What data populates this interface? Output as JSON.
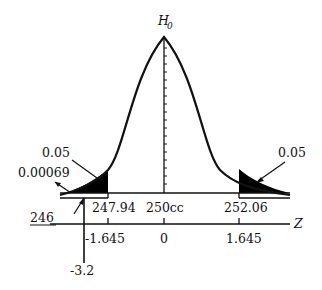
{
  "diagram": {
    "type": "normal-distribution-two-tailed-test",
    "null_hypothesis_label": "H",
    "null_hypothesis_subscript": "0",
    "colors": {
      "ink": "#111111",
      "shade": "#000000",
      "background": "#ffffff"
    },
    "tail_areas": {
      "left": "0.05",
      "right": "0.05",
      "p_value": "0.00069"
    },
    "x_axis": {
      "labels": [
        "246",
        "247.94",
        "250cc",
        "252.06"
      ]
    },
    "z_axis": {
      "name": "Z",
      "labels": [
        "-1.645",
        "0",
        "1.645"
      ],
      "observed": "-3.2"
    }
  }
}
